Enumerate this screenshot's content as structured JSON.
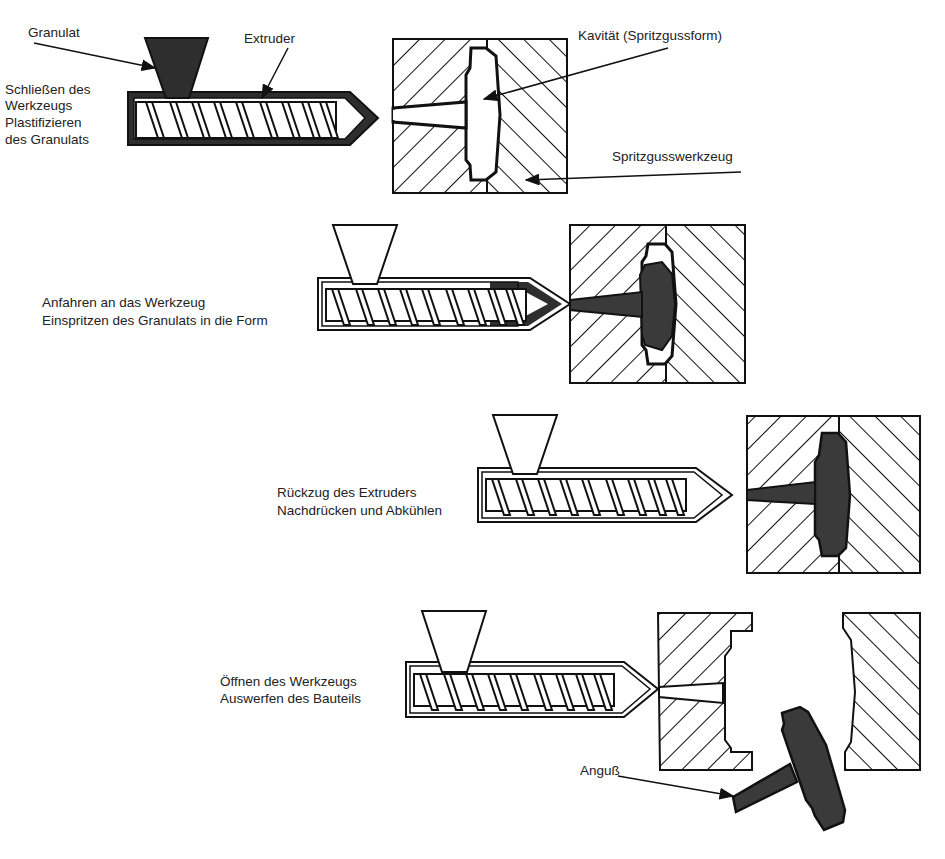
{
  "diagram": {
    "type": "process",
    "colors": {
      "ink": "#111111",
      "melt": "#3a3a3a",
      "background": "#ffffff"
    },
    "annotations": {
      "granulat": "Granulat",
      "extruder": "Extruder",
      "kavitaet": "Kavität (Spritzgussform)",
      "werkzeug": "Spritzgusswerkzeug",
      "anguss": "Anguß"
    },
    "steps": [
      {
        "line1": "Schließen des",
        "line2": "Werkzeugs",
        "line3": "Plastifizieren",
        "line4": "des Granulats"
      },
      {
        "line1": "Anfahren an das Werkzeug",
        "line2": "Einspritzen des Granulats in die Form"
      },
      {
        "line1": "Rückzug des Extruders",
        "line2": "Nachdrücken und Abkühlen"
      },
      {
        "line1": "Öffnen des Werkzeugs",
        "line2": "Auswerfen des Bauteils"
      }
    ]
  }
}
